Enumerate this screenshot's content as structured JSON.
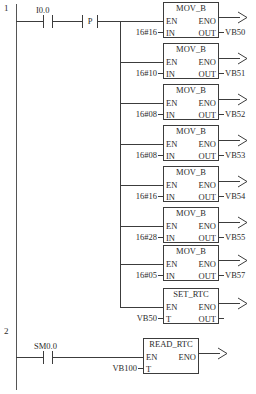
{
  "diagram": {
    "type": "ladder-logic",
    "title": "",
    "colors": {
      "line": "#3c3c3c",
      "rail": "#555555",
      "text": "#2b2b2b",
      "background": "#ffffff"
    },
    "rungs": [
      {
        "number": "1",
        "contacts": [
          {
            "label": "I0.0",
            "kind": "normally-open"
          }
        ],
        "edge": {
          "label": "P",
          "kind": "positive-transition"
        },
        "blocks": [
          {
            "name": "MOV_B",
            "en": "EN",
            "eno": "ENO",
            "in_label": "IN",
            "out_label": "OUT",
            "in_value": "16#16",
            "out_value": "VB50"
          },
          {
            "name": "MOV_B",
            "en": "EN",
            "eno": "ENO",
            "in_label": "IN",
            "out_label": "OUT",
            "in_value": "16#10",
            "out_value": "VB51"
          },
          {
            "name": "MOV_B",
            "en": "EN",
            "eno": "ENO",
            "in_label": "IN",
            "out_label": "OUT",
            "in_value": "16#08",
            "out_value": "VB52"
          },
          {
            "name": "MOV_B",
            "en": "EN",
            "eno": "ENO",
            "in_label": "IN",
            "out_label": "OUT",
            "in_value": "16#08",
            "out_value": "VB53"
          },
          {
            "name": "MOV_B",
            "en": "EN",
            "eno": "ENO",
            "in_label": "IN",
            "out_label": "OUT",
            "in_value": "16#16",
            "out_value": "VB54"
          },
          {
            "name": "MOV_B",
            "en": "EN",
            "eno": "ENO",
            "in_label": "IN",
            "out_label": "OUT",
            "in_value": "16#28",
            "out_value": "VB55"
          },
          {
            "name": "MOV_B",
            "en": "EN",
            "eno": "ENO",
            "in_label": "IN",
            "out_label": "OUT",
            "in_value": "16#05",
            "out_value": "VB57"
          },
          {
            "name": "SET_RTC",
            "en": "EN",
            "eno": "ENO",
            "in_label": "T",
            "out_label": "OUT",
            "in_value": "VB50",
            "out_value": ""
          }
        ]
      },
      {
        "number": "2",
        "contacts": [
          {
            "label": "SM0.0",
            "kind": "normally-open"
          }
        ],
        "edge": null,
        "blocks": [
          {
            "name": "READ_RTC",
            "en": "EN",
            "eno": "ENO",
            "in_label": "T",
            "out_label": "",
            "in_value": "VB100",
            "out_value": ""
          }
        ]
      }
    ]
  }
}
